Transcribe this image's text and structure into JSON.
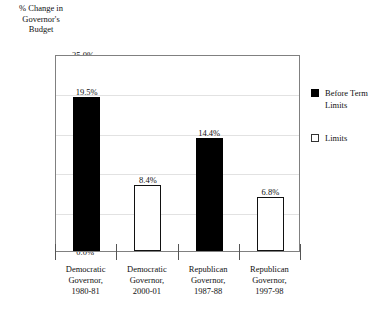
{
  "chart_data": {
    "type": "bar",
    "title": "",
    "ylabel": "% Change in Governor's Budget",
    "ylabel_lines": [
      "% Change in",
      "Governor's",
      "Budget"
    ],
    "xlabel": "",
    "ylim": [
      0,
      25
    ],
    "grid": true,
    "legend_position": "right",
    "categories": [
      "Democratic Governor, 1980-81",
      "Democratic Governor, 2000-01",
      "Republican Governor, 1987-88",
      "Republican Governor, 1997-98"
    ],
    "category_lines": [
      [
        "Democratic",
        "Governor,",
        "1980-81"
      ],
      [
        "Democratic",
        "Governor,",
        "2000-01"
      ],
      [
        "Republican",
        "Governor,",
        "1987-88"
      ],
      [
        "Republican",
        "Governor,",
        "1997-98"
      ]
    ],
    "values": [
      19.5,
      8.4,
      14.4,
      6.8
    ],
    "value_labels": [
      "19.5%",
      "8.4%",
      "14.4%",
      "6.8%"
    ],
    "series_of_bar": [
      "before",
      "after",
      "before",
      "after"
    ],
    "yticks": [
      25,
      20,
      15,
      10,
      5,
      0
    ],
    "ytick_labels": [
      "25.0%",
      "20.0%",
      "15.0%",
      "10.0%",
      "5.0%",
      "0.0%"
    ],
    "colors": {
      "before_fill": "#000000",
      "after_fill": "#ffffff",
      "bar_outline": "#111111",
      "gridline": "#e2e2e2",
      "frame": "#808080",
      "text": "#111111",
      "background": "#ffffff"
    }
  },
  "legend": {
    "items": [
      {
        "swatch": "filled",
        "lines": [
          "Before Term",
          "Limits"
        ]
      },
      {
        "swatch": "hollow",
        "lines": [
          "",
          "Limits"
        ]
      }
    ]
  }
}
